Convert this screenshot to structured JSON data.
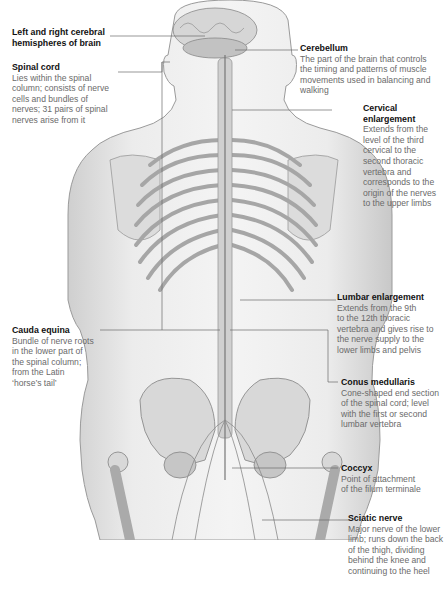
{
  "diagram": {
    "labels": [
      {
        "id": "cerebral",
        "title": "Left and right cerebral hemispheres of brain",
        "lines_title": [
          "Left and right cerebral",
          "hemispheres of brain"
        ],
        "desc": []
      },
      {
        "id": "spinal_cord",
        "title": "Spinal cord",
        "desc": [
          "Lies within the spinal",
          "column; consists of nerve",
          "cells and bundles of",
          "nerves; 31 pairs of spinal",
          "nerves arise from it"
        ]
      },
      {
        "id": "cerebellum",
        "title": "Cerebellum",
        "desc": [
          "The part of the brain that controls",
          "the timing and patterns of muscle",
          "movements used in balancing and",
          "walking"
        ]
      },
      {
        "id": "cervical",
        "title": "Cervical enlargement",
        "lines_title": [
          "Cervical",
          "enlargement"
        ],
        "desc": [
          "Extends from the",
          "level of the third",
          "cervical to the",
          "second thoracic",
          "vertebra and",
          "corresponds to the",
          "origin of the nerves",
          "to the upper limbs"
        ]
      },
      {
        "id": "lumbar",
        "title": "Lumbar enlargement",
        "desc": [
          "Extends from the 9th",
          "to the 12th thoracic",
          "vertebra and gives rise to",
          "the nerve supply to the",
          "lower limbs and pelvis"
        ]
      },
      {
        "id": "cauda",
        "title": "Cauda equina",
        "desc": [
          "Bundle of nerve roots",
          "in the lower part of",
          "the spinal column;",
          "from the Latin",
          "‘horse’s tail’"
        ]
      },
      {
        "id": "conus",
        "title": "Conus medullaris",
        "desc": [
          "Cone-shaped end section",
          "of the spinal cord; level",
          "with the first or second",
          "lumbar vertebra"
        ]
      },
      {
        "id": "coccyx",
        "title": "Coccyx",
        "desc": [
          "Point of attachment",
          "of the filum terminale"
        ]
      },
      {
        "id": "sciatic",
        "title": "Sciatic nerve",
        "desc": [
          "Major nerve of the lower",
          "limb; runs down the back",
          "of the thigh, dividing",
          "behind the knee and",
          "continuing to the heel"
        ]
      }
    ]
  }
}
